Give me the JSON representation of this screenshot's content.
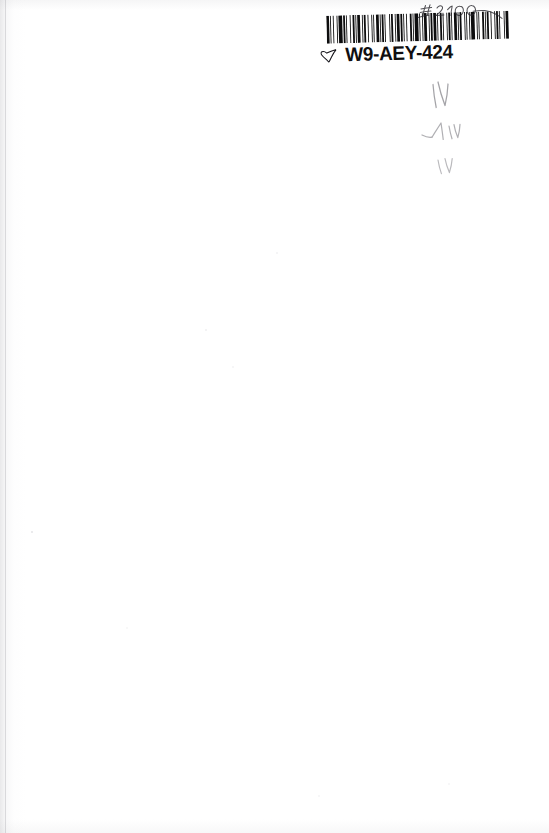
{
  "page": {
    "kind": "scanned-book-page",
    "background_color": "#ffffff",
    "ink_color": "#100f10",
    "pencil_color": "#6d6d73",
    "width": 549,
    "height": 833,
    "content_note": "Blank page; only a barcode sticker and faint pencil marks appear."
  },
  "sticker": {
    "label_text": "W9-AEY-424",
    "icon_name": "hand-pointing-glyph",
    "barcode": {
      "type": "code-128",
      "encoded_value": "W9-AEY-424",
      "bar_color": "#0d0d0e",
      "background_color": "#ffffff",
      "pattern": [
        3,
        1,
        1,
        2,
        1,
        3,
        1,
        1,
        4,
        1,
        2,
        1,
        1,
        3,
        1,
        2,
        2,
        1,
        1,
        1,
        3,
        2,
        1,
        1,
        2,
        2,
        1,
        3,
        1,
        1,
        1,
        2,
        3,
        1,
        1,
        1,
        2,
        1,
        1,
        4,
        1,
        1,
        2,
        2,
        1,
        1,
        3,
        1,
        2,
        1,
        1,
        2,
        1,
        3,
        2,
        1,
        1,
        1,
        4,
        1,
        1,
        2,
        1,
        1,
        3,
        2,
        1,
        1,
        2,
        1,
        3,
        1,
        1,
        2,
        2,
        1,
        1,
        3,
        1,
        1,
        2,
        1,
        1,
        2,
        3,
        1,
        1,
        1,
        2,
        3,
        1,
        1,
        1,
        2,
        1,
        1,
        4,
        2,
        1,
        1,
        1,
        3,
        2,
        1,
        1,
        1,
        2,
        2,
        1,
        3,
        1,
        1,
        2,
        1,
        1,
        4,
        1,
        1,
        3,
        2
      ]
    }
  },
  "annotations": {
    "price_mark": {
      "name": "handwritten-price",
      "reading": "#2100",
      "medium": "ballpoint-pen"
    },
    "pencil_marks": [
      {
        "name": "pencil-mark-upper",
        "reading": "W"
      },
      {
        "name": "pencil-mark-middle",
        "reading": "AV"
      },
      {
        "name": "pencil-mark-lower",
        "reading": "A"
      }
    ]
  }
}
